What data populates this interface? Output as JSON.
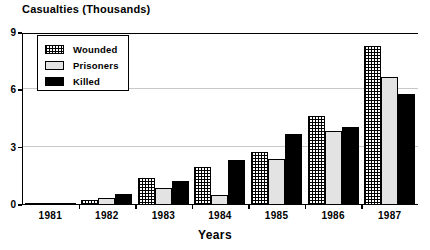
{
  "chart_data": {
    "type": "bar",
    "title": "Casualties (Thousands)",
    "xlabel": "Years",
    "ylabel": "",
    "ylim": [
      0,
      9
    ],
    "yticks": [
      0,
      3,
      6,
      9
    ],
    "grid": true,
    "legend_position": "top-left",
    "categories": [
      "1981",
      "1982",
      "1983",
      "1984",
      "1985",
      "1986",
      "1987"
    ],
    "series": [
      {
        "name": "Wounded",
        "color": "#ffffff",
        "pattern": "checkered-hatch",
        "values": [
          0.05,
          0.25,
          1.4,
          2.0,
          2.8,
          4.65,
          8.3
        ]
      },
      {
        "name": "Prisoners",
        "color": "#e3e3e3",
        "pattern": "solid-light-gray",
        "values": [
          0.04,
          0.35,
          0.9,
          0.5,
          2.4,
          3.85,
          6.7
        ]
      },
      {
        "name": "Killed",
        "color": "#000000",
        "pattern": "solid-black",
        "values": [
          0.07,
          0.6,
          1.25,
          2.35,
          3.7,
          4.1,
          5.8
        ]
      }
    ]
  },
  "axes": {
    "y_tick_labels": [
      "9",
      "6",
      "3",
      "0"
    ],
    "x_tick_labels": [
      "1981",
      "1982",
      "1983",
      "1984",
      "1985",
      "1986",
      "1987"
    ],
    "x_axis_title": "Years",
    "y_axis_title": "Casualties (Thousands)"
  },
  "legend": {
    "entries": [
      {
        "label": "Wounded"
      },
      {
        "label": "Prisoners"
      },
      {
        "label": "Killed"
      }
    ]
  }
}
